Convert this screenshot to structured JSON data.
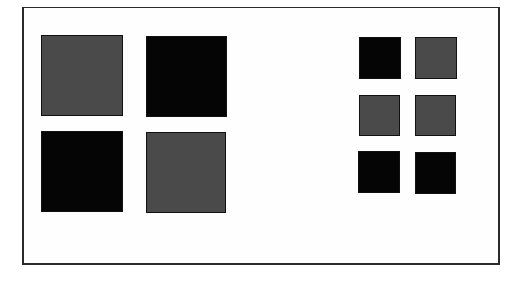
{
  "colors": {
    "gray": "#4a4a4a",
    "black": "#050505",
    "frame": "#2a2a2a",
    "background": "#ffffff"
  },
  "groups": [
    {
      "name": "large-grid",
      "rows": 2,
      "cols": 2,
      "squares": [
        {
          "row": 0,
          "col": 0,
          "fill": "gray"
        },
        {
          "row": 0,
          "col": 1,
          "fill": "black"
        },
        {
          "row": 1,
          "col": 0,
          "fill": "black"
        },
        {
          "row": 1,
          "col": 1,
          "fill": "gray"
        }
      ]
    },
    {
      "name": "small-grid",
      "rows": 3,
      "cols": 2,
      "squares": [
        {
          "row": 0,
          "col": 0,
          "fill": "black"
        },
        {
          "row": 0,
          "col": 1,
          "fill": "gray"
        },
        {
          "row": 1,
          "col": 0,
          "fill": "gray"
        },
        {
          "row": 1,
          "col": 1,
          "fill": "gray"
        },
        {
          "row": 2,
          "col": 0,
          "fill": "black"
        },
        {
          "row": 2,
          "col": 1,
          "fill": "black"
        }
      ]
    }
  ]
}
